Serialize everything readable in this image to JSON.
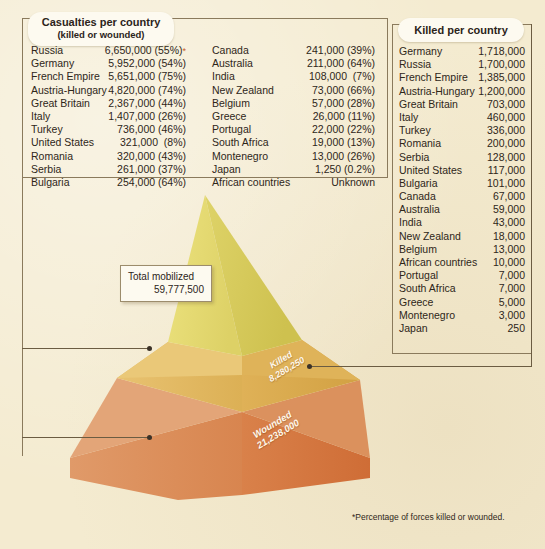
{
  "casualties_panel": {
    "title": "Casualties per country",
    "subtitle": "(killed or wounded)",
    "column_a": [
      {
        "country": "Russia",
        "value": "6,650,000 (55%)",
        "star": "*"
      },
      {
        "country": "Germany",
        "value": "5,952,000 (54%)",
        "star": ""
      },
      {
        "country": "French Empire",
        "value": "5,651,000 (75%)",
        "star": ""
      },
      {
        "country": "Austria-Hungary",
        "value": "4,820,000 (74%)",
        "star": ""
      },
      {
        "country": "Great Britain",
        "value": "2,367,000 (44%)",
        "star": ""
      },
      {
        "country": "Italy",
        "value": "1,407,000 (26%)",
        "star": ""
      },
      {
        "country": "Turkey",
        "value": "736,000 (46%)",
        "star": ""
      },
      {
        "country": "United States",
        "value": "321,000  (8%)",
        "star": ""
      },
      {
        "country": "Romania",
        "value": "320,000 (43%)",
        "star": ""
      },
      {
        "country": "Serbia",
        "value": "261,000 (37%)",
        "star": ""
      },
      {
        "country": "Bulgaria",
        "value": "254,000 (64%)",
        "star": ""
      }
    ],
    "column_b": [
      {
        "country": "Canada",
        "value": "241,000 (39%)"
      },
      {
        "country": "Australia",
        "value": "211,000 (64%)"
      },
      {
        "country": "India",
        "value": "108,000  (7%)"
      },
      {
        "country": "New Zealand",
        "value": "73,000 (66%)"
      },
      {
        "country": "Belgium",
        "value": "57,000 (28%)"
      },
      {
        "country": "Greece",
        "value": "26,000 (11%)"
      },
      {
        "country": "Portugal",
        "value": "22,000 (22%)"
      },
      {
        "country": "South Africa",
        "value": "19,000 (13%)"
      },
      {
        "country": "Montenegro",
        "value": "13,000 (26%)"
      },
      {
        "country": "Japan",
        "value": "1,250 (0.2%)"
      },
      {
        "country": "African countries",
        "value": "Unknown"
      }
    ]
  },
  "killed_panel": {
    "title": "Killed per country",
    "rows": [
      {
        "country": "Germany",
        "value": "1,718,000"
      },
      {
        "country": "Russia",
        "value": "1,700,000"
      },
      {
        "country": "French Empire",
        "value": "1,385,000"
      },
      {
        "country": "Austria-Hungary",
        "value": "1,200,000"
      },
      {
        "country": "Great Britain",
        "value": "703,000"
      },
      {
        "country": "Italy",
        "value": "460,000"
      },
      {
        "country": "Turkey",
        "value": "336,000"
      },
      {
        "country": "Romania",
        "value": "200,000"
      },
      {
        "country": "Serbia",
        "value": "128,000"
      },
      {
        "country": "United States",
        "value": "117,000"
      },
      {
        "country": "Bulgaria",
        "value": "101,000"
      },
      {
        "country": "Canada",
        "value": "67,000"
      },
      {
        "country": "Australia",
        "value": "59,000"
      },
      {
        "country": "India",
        "value": "43,000"
      },
      {
        "country": "New Zealand",
        "value": "18,000"
      },
      {
        "country": "Belgium",
        "value": "13,000"
      },
      {
        "country": "African countries",
        "value": "10,000"
      },
      {
        "country": "Portugal",
        "value": "7,000"
      },
      {
        "country": "South Africa",
        "value": "7,000"
      },
      {
        "country": "Greece",
        "value": "5,000"
      },
      {
        "country": "Montenegro",
        "value": "3,000"
      },
      {
        "country": "Japan",
        "value": "250"
      }
    ]
  },
  "pyramid": {
    "total_label": "Total mobilized",
    "total_value": "59,777,500",
    "killed_label": "Killed",
    "killed_value": "8,280,250",
    "wounded_label": "Wounded",
    "wounded_value": "21,238,000"
  },
  "footnote": "*Percentage of forces killed or wounded.",
  "colors": {
    "background": "#f4ebd0",
    "top_light": "#e8de7a",
    "top_dark": "#d9cc5c",
    "mid_light": "#e2b85c",
    "mid_dark": "#d8a948",
    "base_light": "#dd8a56",
    "base_dark": "#d4743f",
    "accent_star": "#c85a28",
    "rule": "#8a7a5c"
  },
  "chart_data": {
    "type": "pie",
    "categories": [
      "Total mobilized",
      "Killed",
      "Wounded"
    ],
    "values": [
      59777500,
      8280250,
      21238000
    ],
    "ylabel": "People",
    "annotations": [
      "*Percentage of forces killed or wounded."
    ]
  }
}
